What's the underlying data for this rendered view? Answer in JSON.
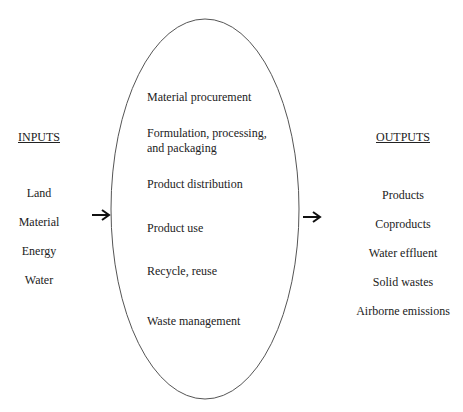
{
  "inputs": {
    "heading": "INPUTS",
    "items": [
      "Land",
      "Material",
      "Energy",
      "Water"
    ]
  },
  "outputs": {
    "heading": "OUTPUTS",
    "items": [
      "Products",
      "Coproducts",
      "Water effluent",
      "Solid wastes",
      "Airborne emissions"
    ]
  },
  "stages": [
    "Material procurement",
    "Formulation, processing,",
    "and packaging",
    "Product distribution",
    "Product use",
    "Recycle, reuse",
    "Waste management"
  ]
}
